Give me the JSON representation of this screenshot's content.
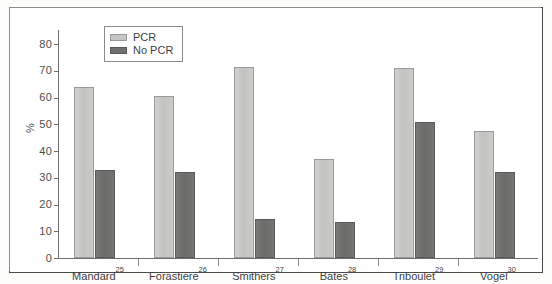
{
  "chart_data": {
    "type": "bar",
    "title": "",
    "xlabel": "",
    "ylabel": "%",
    "ylim": [
      0,
      80
    ],
    "yticks": [
      0,
      10,
      20,
      30,
      40,
      50,
      60,
      70,
      80
    ],
    "grid": false,
    "legend_position": "top-left",
    "categories": [
      "Mandard",
      "Forastiere",
      "Smithers",
      "Bates",
      "Triboulet",
      "Vogel"
    ],
    "category_references": [
      "25",
      "26",
      "27",
      "28",
      "29",
      "30"
    ],
    "series": [
      {
        "name": "PCR",
        "color": "#c6c6c4",
        "values": [
          64,
          60.5,
          71.5,
          37,
          71,
          47.5
        ]
      },
      {
        "name": "No PCR",
        "color": "#6f6f6d",
        "values": [
          33,
          32,
          14.5,
          13.5,
          51,
          32
        ]
      }
    ]
  },
  "legend": {
    "items": [
      {
        "label": "PCR",
        "swatch": "pcr"
      },
      {
        "label": "No PCR",
        "swatch": "nopcr"
      }
    ]
  }
}
